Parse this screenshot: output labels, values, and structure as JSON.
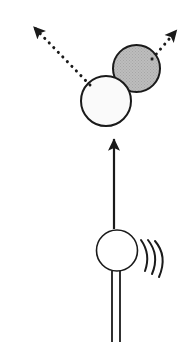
{
  "figure": {
    "canvas": {
      "width": 190,
      "height": 342
    },
    "background_color": "#FFFFFF"
  },
  "colors": {
    "stroke": "#1A1A1A",
    "gray_fill": "#B8B8B8",
    "white_fill": "#FAFAFA",
    "background": "#FFFFFF"
  },
  "elements": {
    "gray_particle": {
      "name": "gray-particle",
      "cx": 136.5,
      "cy": 68.5,
      "r": 23.5,
      "fill": "#B8B8B8",
      "stroke": "#1A1A1A",
      "stroke_width": 2,
      "texture": "stipple"
    },
    "white_particle": {
      "name": "white-particle",
      "cx": 106.0,
      "cy": 101.0,
      "r": 25.0,
      "fill": "#FAFAFA",
      "stroke": "#1A1A1A",
      "stroke_width": 2,
      "texture": "none"
    },
    "source_body": {
      "name": "source-body",
      "cx": 117.0,
      "cy": 250.5,
      "r": 20.5,
      "fill": "#FFFFFF",
      "stroke": "#1A1A1A",
      "stroke_width": 1.6
    },
    "incoming_arrow": {
      "name": "incoming-arrow",
      "style": "solid",
      "x1": 114.0,
      "y1": 229.0,
      "x2": 114.0,
      "y2": 131.0,
      "stroke_width": 2.2,
      "head": "filled-triangle",
      "head_width": 9,
      "head_length": 13
    },
    "recoil_arrow_left": {
      "name": "recoil-arrow-left",
      "style": "dotted",
      "x1": 90.0,
      "y1": 85.0,
      "x2": 28.0,
      "y2": 21.0,
      "stroke_width": 3.0,
      "dot_gap": 6.4,
      "head": "filled-triangle",
      "head_width": 11,
      "head_length": 15
    },
    "recoil_arrow_right": {
      "name": "recoil-arrow-right",
      "style": "dotted",
      "x1": 152.0,
      "y1": 59.0,
      "x2": 182.0,
      "y2": 24.0,
      "stroke_width": 3.0,
      "dot_gap": 6.4,
      "head": "filled-triangle",
      "head_width": 11,
      "head_length": 15
    },
    "stem": {
      "name": "source-stem",
      "line_left_x": 112.0,
      "line_right_x": 120.0,
      "y_top": 271.0,
      "y_bottom": 342.0,
      "stroke_width": 1.8
    },
    "vibration_arcs": {
      "name": "vibration-arcs",
      "count": 3,
      "stroke_width": 2.0,
      "paths": [
        "M 141 240 Q 151 254 145 271",
        "M 148 240 Q 160 255 152 274",
        "M 155 241 Q 168 256 159 277"
      ]
    }
  }
}
